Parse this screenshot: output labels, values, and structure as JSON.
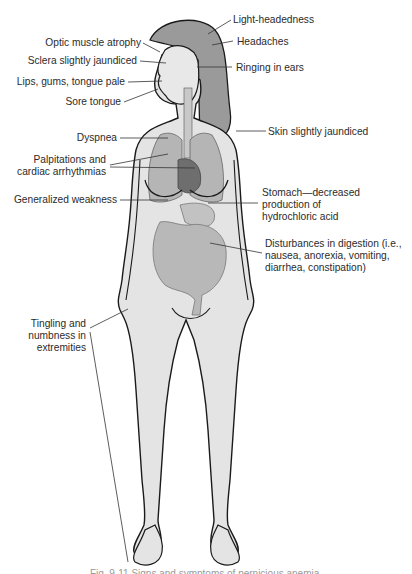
{
  "figure": {
    "colors": {
      "outline": "#1a1a1a",
      "skin": "#e4e4e4",
      "hair": "#9a9a9a",
      "organs": "#b5b5b5",
      "heart": "#6e6e6e",
      "leader_line": "#333333",
      "text": "#2b2b2b"
    },
    "labels_left": [
      {
        "id": "optic",
        "text": "Optic muscle atrophy"
      },
      {
        "id": "sclera",
        "text": "Sclera slightly jaundiced"
      },
      {
        "id": "lips",
        "text": "Lips, gums, tongue pale"
      },
      {
        "id": "tongue",
        "text": "Sore tongue"
      },
      {
        "id": "dyspnea",
        "text": "Dyspnea"
      },
      {
        "id": "palpitations",
        "lines": [
          "Palpitations and",
          "cardiac arrhythmias"
        ]
      },
      {
        "id": "weakness",
        "text": "Generalized weakness"
      },
      {
        "id": "tingling",
        "lines": [
          "Tingling and",
          "numbness in",
          "extremities"
        ]
      }
    ],
    "labels_right": [
      {
        "id": "light",
        "text": "Light-headedness"
      },
      {
        "id": "headaches",
        "text": "Headaches"
      },
      {
        "id": "ringing",
        "text": "Ringing in ears"
      },
      {
        "id": "skin",
        "text": "Skin slightly jaundiced"
      },
      {
        "id": "stomach",
        "lines": [
          "Stomach—decreased",
          "production of",
          "hydrochloric acid"
        ]
      },
      {
        "id": "digestion",
        "lines": [
          "Disturbances in digestion (i.e.,",
          "nausea, anorexia, vomiting,",
          "diarrhea, constipation)"
        ]
      }
    ],
    "caption": "Fig. 9-11 Signs and symptoms of pernicious anemia."
  }
}
